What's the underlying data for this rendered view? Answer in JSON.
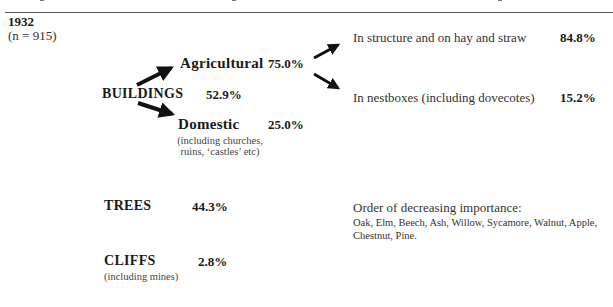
{
  "header": {
    "year": "1932",
    "sample": "(n = 915)"
  },
  "buildings": {
    "label": "BUILDINGS",
    "percent": "52.9%",
    "agricultural": {
      "label": "Agricultural",
      "percent": "75.0%",
      "sub": [
        {
          "label": "In structure and on hay and straw",
          "percent": "84.8%"
        },
        {
          "label": "In nestboxes (including dovecotes)",
          "percent": "15.2%"
        }
      ]
    },
    "domestic": {
      "label": "Domestic",
      "percent": "25.0%",
      "note_line1": "(including churches,",
      "note_line2": "ruins, ‘castles’ etc)"
    }
  },
  "trees": {
    "label": "TREES",
    "percent": "44.3%",
    "order_heading": "Order of decreasing importance:",
    "order_list": "Oak, Elm, Beech, Ash, Willow, Sycamore, Walnut, Apple, Chestnut, Pine."
  },
  "cliffs": {
    "label": "CLIFFS",
    "percent": "2.8%",
    "note": "(including mines)"
  },
  "colors": {
    "text": "#1a1a1a",
    "muted": "#444444",
    "rule": "#555555"
  }
}
